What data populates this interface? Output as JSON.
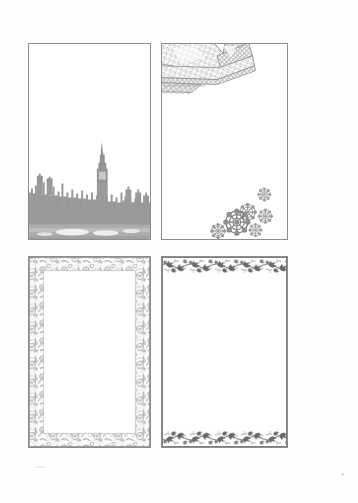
{
  "page": {
    "background_color": "#fefefe",
    "sheet_width": 358,
    "sheet_height": 503,
    "panel_border_color": "#8d8d8d",
    "ink_color": "#8f8f8f",
    "caption": "Sheet of four decorative page border templates"
  },
  "panels": [
    {
      "id": "panel-skyline",
      "name": "london-skyline-border",
      "label": "London skyline silhouette border",
      "position": "top-left",
      "motif": "london-skyline",
      "motif_description": "Grey silhouette of the Houses of Parliament and Big Ben with river reflection along the bottom edge",
      "decoration_sides": [
        "bottom"
      ],
      "ink_color": "#969696",
      "reflection_color": "#b4b4b4",
      "x": 28,
      "y": 43,
      "width": 123,
      "height": 197
    },
    {
      "id": "panel-lace-corner",
      "name": "lace-corner-rosette-border",
      "label": "Lace corner and rosette border",
      "position": "top-right",
      "motif": "lace-ribbon-corner-and-flower-rosettes",
      "motif_description": "Folded lace ribbon chevron ornament in the upper-left corner with a scattered cluster of six flower rosettes in the lower-right",
      "decoration_sides": [
        "top-left-corner",
        "bottom-right-corner"
      ],
      "ink_color": "#8a8a8a",
      "rosette_count": 6,
      "x": 161,
      "y": 43,
      "width": 127,
      "height": 197
    },
    {
      "id": "panel-floral-frame",
      "name": "full-floral-frame-border",
      "label": "Full floral frame border",
      "position": "bottom-left",
      "motif": "dense-floral-foliage-frame",
      "motif_description": "Dense floral and foliage band running continuously around all four sides enclosing a blank writing area",
      "decoration_sides": [
        "top",
        "right",
        "bottom",
        "left"
      ],
      "ink_color": "#9a9a9a",
      "band_thickness_px": 15,
      "x": 28,
      "y": 256,
      "width": 123,
      "height": 192
    },
    {
      "id": "panel-ivy-band",
      "name": "ivy-band-border",
      "label": "Ivy band header and footer border",
      "position": "bottom-right",
      "motif": "ivy-vine-band",
      "motif_description": "Repeating ivy vine and leaf band across the top and bottom edges only, with plain left and right margins",
      "decoration_sides": [
        "top",
        "bottom"
      ],
      "ink_color": "#5f5f5f",
      "band_thickness_px": 17,
      "x": 161,
      "y": 256,
      "width": 127,
      "height": 192
    }
  ]
}
